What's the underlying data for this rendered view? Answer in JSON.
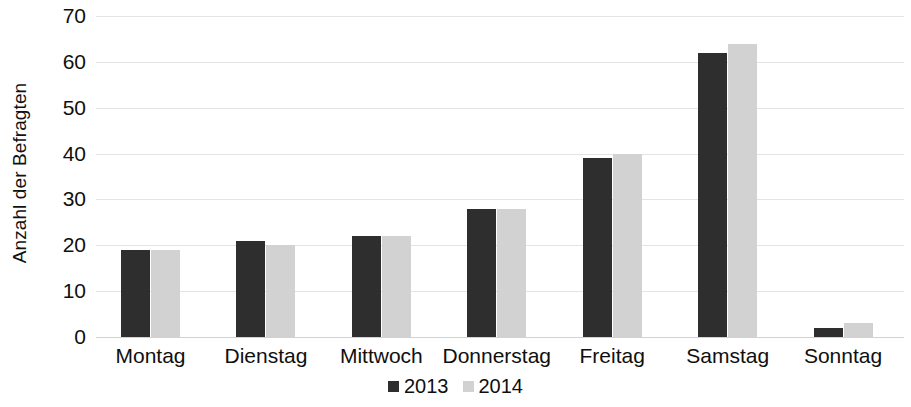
{
  "chart_data": {
    "type": "bar",
    "title": "",
    "subtitle": "",
    "xlabel": "",
    "ylabel": "Anzahl der Befragten",
    "categories": [
      "Montag",
      "Dienstag",
      "Mittwoch",
      "Donnerstag",
      "Freitag",
      "Samstag",
      "Sonntag"
    ],
    "series": [
      {
        "name": "2013",
        "color": "#2e2e2e",
        "values": [
          19,
          21,
          22,
          28,
          39,
          62,
          2
        ]
      },
      {
        "name": "2014",
        "color": "#d2d2d2",
        "values": [
          19,
          20,
          22,
          28,
          40,
          64,
          3
        ]
      }
    ],
    "ylim": [
      0,
      70
    ],
    "yticks": [
      0,
      10,
      20,
      30,
      40,
      50,
      60,
      70
    ],
    "ytick_labels": [
      "0",
      "10",
      "20",
      "30",
      "40",
      "50",
      "60",
      "70"
    ],
    "grid": true,
    "grid_axis": "y",
    "legend_position": "bottom-center",
    "legend_entries": [
      "2013",
      "2014"
    ],
    "background_color": "#ffffff",
    "grid_color": "#e4e4e4"
  }
}
